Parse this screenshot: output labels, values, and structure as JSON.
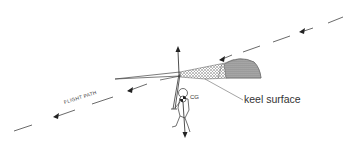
{
  "diagram": {
    "labels": {
      "keel_surface": "keel surface",
      "cg": "CG",
      "flight_path": "FLIGHT PATH"
    },
    "elements": [
      {
        "name": "flight-path-line",
        "description": "dashed line with arrowheads pointing down-left"
      },
      {
        "name": "glider-wing",
        "description": "side view of wing with shaded keel surface"
      },
      {
        "name": "lift-arrow",
        "description": "vertical arrow pointing up"
      },
      {
        "name": "weight-arrow",
        "description": "vertical arrow pointing down from CG"
      },
      {
        "name": "pilot-figure",
        "description": "pilot hanging below wing with control bar"
      }
    ],
    "colors": {
      "line": "#333333",
      "background": "#ffffff"
    }
  }
}
